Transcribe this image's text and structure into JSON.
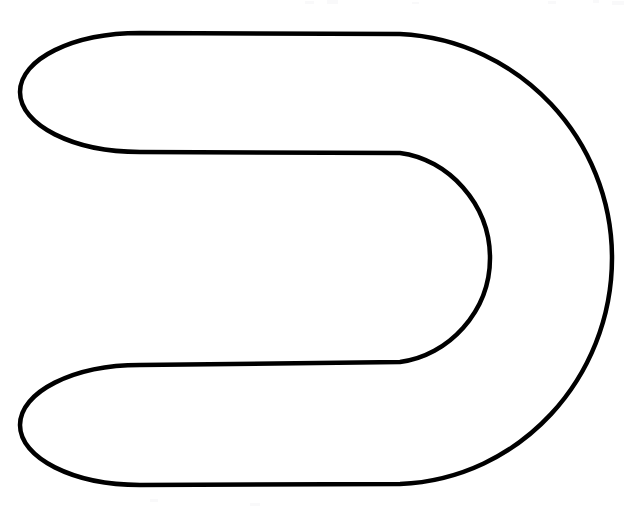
{
  "document": {
    "title": "Horseshoe outline line drawing",
    "background_color": "#ffffff",
    "width": 635,
    "height": 508
  },
  "figure": {
    "name": "horseshoe-outline",
    "stroke_color": "#000000",
    "fill_color": "none",
    "stroke_width": 4.5,
    "geometry": {
      "outer_top_y": 33,
      "outer_bottom_y": 485,
      "outer_left_x": 20,
      "outer_right_x": 612,
      "inner_top_y": 152,
      "inner_bottom_y": 363,
      "inner_right_x": 490,
      "inner_left_x": 20,
      "upper_lobe_y_range": [
        33,
        148
      ],
      "lower_lobe_y_range": [
        365,
        485
      ],
      "right_bend_center_y": 258,
      "straight_run_end_x": 400
    },
    "path": "M 140 33 L 400 34 C 520 40 612 140 612 258 C 612 378 520 479 400 484 L 140 485 C 73 485 20 458 20 425 C 20 392 73 365 140 365 L 400 362 C 448 356 490 312 490 258 C 490 204 448 159 400 153 L 140 152 C 73 152 20 125 20 92 C 20 59 73 33 140 33 Z"
  },
  "scan_artifacts": [
    {
      "x": 305,
      "y": 1,
      "width": 9,
      "height": 3
    },
    {
      "x": 327,
      "y": 0,
      "width": 11,
      "height": 4
    },
    {
      "x": 412,
      "y": 2,
      "width": 7,
      "height": 2
    },
    {
      "x": 548,
      "y": 1,
      "width": 8,
      "height": 3
    },
    {
      "x": 593,
      "y": 0,
      "width": 6,
      "height": 3
    },
    {
      "x": 612,
      "y": 1,
      "width": 12,
      "height": 4
    },
    {
      "x": 250,
      "y": 503,
      "width": 10,
      "height": 3
    },
    {
      "x": 150,
      "y": 499,
      "width": 8,
      "height": 3
    }
  ]
}
